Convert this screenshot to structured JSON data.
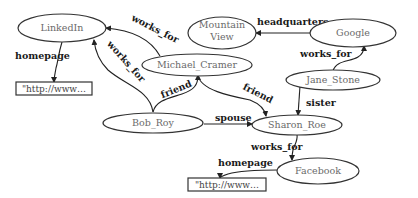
{
  "diagram": {
    "type": "knowledge-graph",
    "nodes": [
      {
        "id": "linkedin",
        "label": "LinkedIn",
        "shape": "ellipse"
      },
      {
        "id": "mountain_view",
        "label_line1": "Mountain",
        "label_line2": "View",
        "shape": "ellipse"
      },
      {
        "id": "google",
        "label": "Google",
        "shape": "ellipse"
      },
      {
        "id": "michael_cramer",
        "label": "Michael_Cramer",
        "shape": "ellipse"
      },
      {
        "id": "jane_stone",
        "label": "Jane_Stone",
        "shape": "ellipse"
      },
      {
        "id": "bob_roy",
        "label": "Bob_Roy",
        "shape": "ellipse"
      },
      {
        "id": "sharon_roe",
        "label": "Sharon_Roe",
        "shape": "ellipse"
      },
      {
        "id": "facebook",
        "label": "Facebook",
        "shape": "ellipse"
      },
      {
        "id": "linkedin_url",
        "label": "\"http://www…",
        "shape": "rect"
      },
      {
        "id": "facebook_url",
        "label": "\"http://www…",
        "shape": "rect"
      }
    ],
    "edges": [
      {
        "from": "linkedin",
        "to": "linkedin_url",
        "label": "homepage"
      },
      {
        "from": "michael_cramer",
        "to": "linkedin",
        "label": "works_for"
      },
      {
        "from": "bob_roy",
        "to": "linkedin",
        "label": "works_for"
      },
      {
        "from": "google",
        "to": "mountain_view",
        "label": "headquarters"
      },
      {
        "from": "jane_stone",
        "to": "google",
        "label": "works_for"
      },
      {
        "from": "bob_roy",
        "to": "michael_cramer",
        "label": "friend"
      },
      {
        "from": "michael_cramer",
        "to": "sharon_roe",
        "label": "friend"
      },
      {
        "from": "bob_roy",
        "to": "sharon_roe",
        "label": "spouse"
      },
      {
        "from": "jane_stone",
        "to": "sharon_roe",
        "label": "sister"
      },
      {
        "from": "sharon_roe",
        "to": "facebook",
        "label": "works_for"
      },
      {
        "from": "facebook",
        "to": "facebook_url",
        "label": "homepage"
      }
    ]
  }
}
